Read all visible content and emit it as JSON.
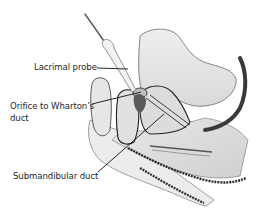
{
  "figure": {
    "colors": {
      "background": "#ffffff",
      "tissue_fill": "#e4e4e4",
      "tissue_light": "#efefef",
      "outline": "#2b2b2b",
      "shadow": "#3a3a3a",
      "leader_line": "#111111",
      "text": "#1f1f1f"
    }
  },
  "labels": {
    "probe": "Lacrimal probe",
    "orifice_line1": "Orifice to Wharton’s",
    "orifice_line2": "duct",
    "submandibular": "Submandibular duct"
  }
}
